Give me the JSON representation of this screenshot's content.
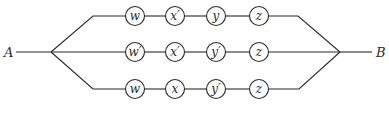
{
  "diagram": {
    "type": "series-parallel circuit",
    "start_label": "A",
    "end_label": "B",
    "rows": [
      {
        "y": 16,
        "nodes": [
          "w",
          "x′",
          "y",
          "z"
        ]
      },
      {
        "y": 52,
        "nodes": [
          "w′",
          "x′",
          "y′",
          "z"
        ]
      },
      {
        "y": 89,
        "nodes": [
          "w",
          "x",
          "y′",
          "z"
        ]
      }
    ],
    "node_x": [
      135,
      175,
      216,
      259
    ],
    "node_radius": 9.5,
    "colors": {
      "stroke": "#2a2a2a",
      "background": "#ffffff"
    }
  }
}
